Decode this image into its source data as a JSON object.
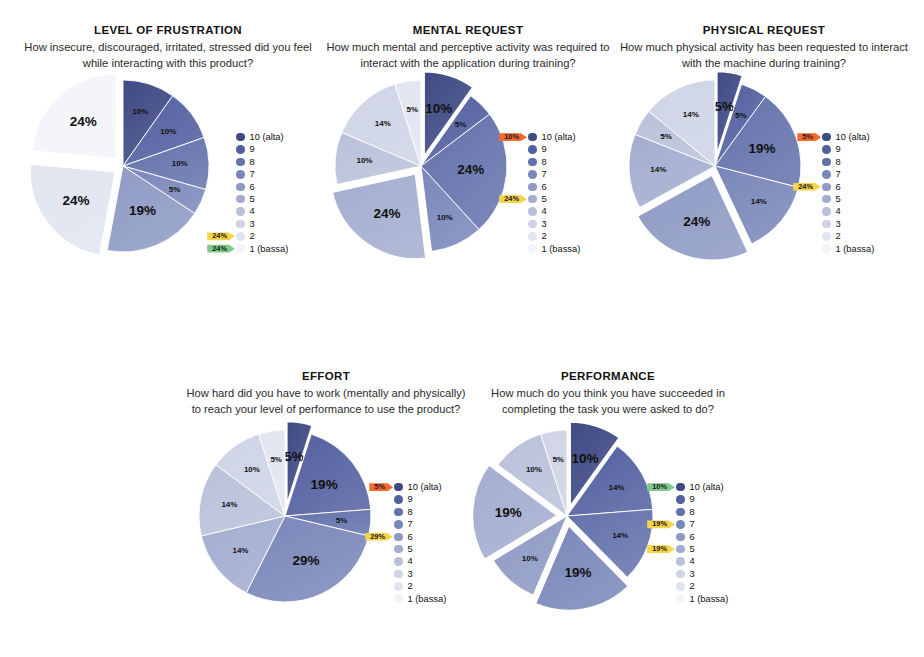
{
  "page": {
    "legend_scale": [
      "10 (alta)",
      "9",
      "8",
      "7",
      "6",
      "5",
      "4",
      "3",
      "2",
      "1 (bassa)"
    ],
    "legend_colors": [
      "#3f4a84",
      "#5360a0",
      "#6472ac",
      "#7a87ba",
      "#8e9ac4",
      "#a3adcf",
      "#b9c1da",
      "#ced4e6",
      "#e1e5f0",
      "#f2f4f9"
    ]
  },
  "chart_data": [
    {
      "id": "level-of-frustration",
      "type": "pie",
      "title": "LEVEL OF FRUSTRATION",
      "subtitle": "How insecure, discouraged, irritated, stressed did you feel while interacting with this product?",
      "categories": [
        "10 (alta)",
        "9",
        "8",
        "7",
        "6",
        "5",
        "4",
        "3",
        "2",
        "1 (bassa)"
      ],
      "values": [
        10,
        10,
        10,
        5,
        19,
        0,
        0,
        0,
        24,
        24
      ],
      "slice_labels": [
        "10%",
        "10%",
        "10%",
        "5%",
        "19%",
        "24%",
        "24%"
      ],
      "exploded": [
        "2",
        "1 (bassa)"
      ],
      "callouts": [
        {
          "label": "24%",
          "color": "yellow",
          "target": "2"
        },
        {
          "label": "24%",
          "color": "green",
          "target": "1 (bassa)"
        }
      ]
    },
    {
      "id": "mental-request",
      "type": "pie",
      "title": "MENTAL REQUEST",
      "subtitle": "How much mental and perceptive activity was required to interact with the application during training?",
      "categories": [
        "10 (alta)",
        "9",
        "8",
        "7",
        "6",
        "5",
        "4",
        "3",
        "2",
        "1 (bassa)"
      ],
      "values": [
        10,
        5,
        24,
        10,
        0,
        24,
        10,
        14,
        5,
        0
      ],
      "slice_labels": [
        "10%",
        "5%",
        "24%",
        "10%",
        "24%",
        "10%",
        "14%",
        "5%"
      ],
      "exploded": [
        "10 (alta)",
        "5"
      ],
      "callouts": [
        {
          "label": "10%",
          "color": "orange",
          "target": "10 (alta)"
        },
        {
          "label": "24%",
          "color": "yellow",
          "target": "5"
        }
      ]
    },
    {
      "id": "physical-request",
      "type": "pie",
      "title": "PHYSICAL REQUEST",
      "subtitle": "How much physical activity has been requested to interact with the machine during training?",
      "categories": [
        "10 (alta)",
        "9",
        "8",
        "7",
        "6",
        "5",
        "4",
        "3",
        "2",
        "1 (bassa)"
      ],
      "values": [
        5,
        5,
        19,
        14,
        24,
        14,
        5,
        14,
        0,
        0
      ],
      "slice_labels": [
        "5%",
        "5%",
        "19%",
        "14%",
        "24%",
        "14%",
        "5%",
        "14%"
      ],
      "exploded": [
        "10 (alta)",
        "6"
      ],
      "callouts": [
        {
          "label": "5%",
          "color": "orange",
          "target": "10 (alta)"
        },
        {
          "label": "24%",
          "color": "yellow",
          "target": "6"
        }
      ]
    },
    {
      "id": "effort",
      "type": "pie",
      "title": "EFFORT",
      "subtitle": "How hard did you have to work (mentally and physically) to reach your level of performance to use the product?",
      "categories": [
        "10 (alta)",
        "9",
        "8",
        "7",
        "6",
        "5",
        "4",
        "3",
        "2",
        "1 (bassa)"
      ],
      "values": [
        5,
        19,
        5,
        29,
        0,
        14,
        14,
        10,
        5,
        0
      ],
      "slice_labels": [
        "5%",
        "19%",
        "5%",
        "29%",
        "14%",
        "14%",
        "10%",
        "5%"
      ],
      "exploded": [
        "10 (alta)",
        "6"
      ],
      "callouts": [
        {
          "label": "5%",
          "color": "orange",
          "target": "10 (alta)"
        },
        {
          "label": "29%",
          "color": "yellow",
          "target": "6"
        }
      ]
    },
    {
      "id": "performance",
      "type": "pie",
      "title": "PERFORMANCE",
      "subtitle": "How much do you think you have succeeded in completing the task you were asked to do?",
      "categories": [
        "10 (alta)",
        "9",
        "8",
        "7",
        "6",
        "5",
        "4",
        "3",
        "2",
        "1 (bassa)"
      ],
      "values": [
        10,
        14,
        14,
        19,
        10,
        19,
        10,
        5,
        0,
        0
      ],
      "slice_labels": [
        "10%",
        "14%",
        "14%",
        "19%",
        "10%",
        "19%",
        "10%",
        "5%"
      ],
      "exploded": [
        "10 (alta)",
        "7",
        "5"
      ],
      "callouts": [
        {
          "label": "10%",
          "color": "green",
          "target": "10 (alta)"
        },
        {
          "label": "19%",
          "color": "yellow",
          "target": "7"
        },
        {
          "label": "19%",
          "color": "yellow",
          "target": "5"
        }
      ]
    }
  ],
  "layout": [
    {
      "left": 18,
      "top": 24,
      "width": 300,
      "pie_left": 10,
      "pie_top": 92,
      "pie_size": 190,
      "legend_left": 218,
      "legend_top": 152
    },
    {
      "left": 318,
      "top": 24,
      "width": 300,
      "pie_left": 8,
      "pie_top": 92,
      "pie_size": 190,
      "legend_left": 210,
      "legend_top": 152
    },
    {
      "left": 614,
      "top": 24,
      "width": 300,
      "pie_left": 6,
      "pie_top": 92,
      "pie_size": 190,
      "legend_left": 208,
      "legend_top": 152
    },
    {
      "left": 176,
      "top": 370,
      "width": 300,
      "pie_left": 14,
      "pie_top": 96,
      "pie_size": 190,
      "legend_left": 218,
      "legend_top": 156
    },
    {
      "left": 458,
      "top": 370,
      "width": 300,
      "pie_left": 14,
      "pie_top": 96,
      "pie_size": 190,
      "legend_left": 218,
      "legend_top": 156
    }
  ]
}
